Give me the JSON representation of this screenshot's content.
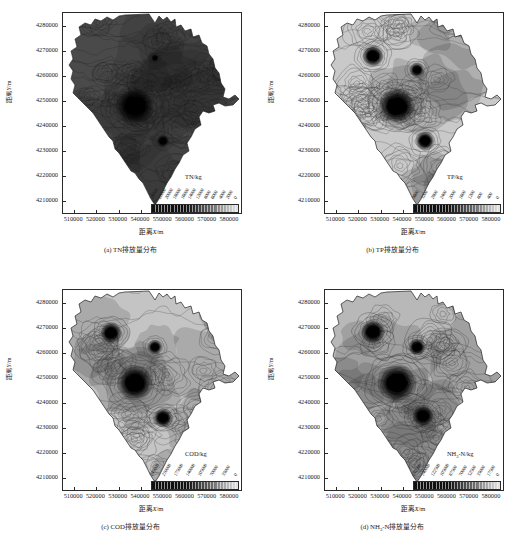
{
  "figure": {
    "axis": {
      "xlabel": "距离X/m",
      "ylabel": "距离Y/m",
      "xticks": [
        "510000",
        "520000",
        "530000",
        "540000",
        "550000",
        "560000",
        "570000",
        "580000"
      ],
      "yticks": [
        "4280000",
        "4270000",
        "4260000",
        "4250000",
        "4240000",
        "4230000",
        "4220000",
        "4210000"
      ],
      "xlim": [
        505000,
        585000
      ],
      "ylim": [
        4205000,
        4285000
      ]
    },
    "panels": [
      {
        "id": "a",
        "caption": "(a) TN排放量分布",
        "legend_title": "TN/kg",
        "legend_labels": [
          "24000",
          "22000",
          "20000",
          "18000",
          "16000",
          "14000",
          "12000",
          "8000",
          "6000",
          "4000",
          "2000",
          "0"
        ],
        "base_fill": "#4a4a4a",
        "contour_color": "#1f1f1f",
        "hotspots": [
          {
            "cx": 72,
            "cy": 93,
            "r": 16,
            "label": "major-hotspot-central"
          },
          {
            "cx": 100,
            "cy": 128,
            "r": 5,
            "label": "hotspot-south"
          },
          {
            "cx": 92,
            "cy": 45,
            "r": 3,
            "label": "hotspot-north"
          }
        ]
      },
      {
        "id": "b",
        "caption": "(b) TP排放量分布",
        "legend_title": "TP/kg",
        "legend_labels": [
          "3600",
          "3200",
          "2800",
          "2400",
          "2000",
          "1600",
          "1200",
          "800",
          "400",
          "0"
        ],
        "base_fill": "#c9c9c9",
        "contour_color": "#3b3b3b",
        "hotspots": [
          {
            "cx": 72,
            "cy": 93,
            "r": 15,
            "label": "major-hotspot-central"
          },
          {
            "cx": 48,
            "cy": 43,
            "r": 9,
            "label": "hotspot-northwest"
          },
          {
            "cx": 92,
            "cy": 57,
            "r": 6,
            "label": "hotspot-north"
          },
          {
            "cx": 100,
            "cy": 128,
            "r": 8,
            "label": "hotspot-south"
          }
        ]
      },
      {
        "id": "c",
        "caption": "(c) COD排放量分布",
        "legend_title": "COD/kg",
        "legend_labels": [
          "245000",
          "210000",
          "175000",
          "140000",
          "105000",
          "70000",
          "35000",
          "0"
        ],
        "base_fill": "#c4c4c4",
        "contour_color": "#3b3b3b",
        "hotspots": [
          {
            "cx": 72,
            "cy": 93,
            "r": 15,
            "label": "major-hotspot-central"
          },
          {
            "cx": 48,
            "cy": 43,
            "r": 9,
            "label": "hotspot-northwest"
          },
          {
            "cx": 92,
            "cy": 57,
            "r": 6,
            "label": "hotspot-north"
          },
          {
            "cx": 100,
            "cy": 128,
            "r": 8,
            "label": "hotspot-south"
          }
        ]
      },
      {
        "id": "d",
        "caption": "(d) NH₃-N排放量分布",
        "legend_title": "NH₃-N/kg",
        "legend_labels": [
          "157500",
          "140000",
          "122500",
          "105000",
          "87500",
          "70000",
          "52500",
          "35000",
          "17500",
          "0"
        ],
        "base_fill": "#b8b8b8",
        "contour_color": "#333333",
        "hotspots": [
          {
            "cx": 72,
            "cy": 93,
            "r": 16,
            "label": "major-hotspot-central"
          },
          {
            "cx": 48,
            "cy": 42,
            "r": 10,
            "label": "hotspot-northwest"
          },
          {
            "cx": 92,
            "cy": 57,
            "r": 7,
            "label": "hotspot-north"
          },
          {
            "cx": 98,
            "cy": 126,
            "r": 9,
            "label": "hotspot-south"
          }
        ]
      }
    ],
    "colorbar": {
      "dark": "#101010",
      "light": "#e8e8e8",
      "segments": 28
    }
  },
  "chart_data": {
    "type": "heatmap",
    "title": "",
    "subtitle": "",
    "xlabel": "距离X/m",
    "ylabel": "距离Y/m",
    "xlim": [
      505000,
      585000
    ],
    "ylim": [
      4205000,
      4285000
    ],
    "xticks": [
      510000,
      520000,
      530000,
      540000,
      550000,
      560000,
      570000,
      580000
    ],
    "yticks": [
      4210000,
      4220000,
      4230000,
      4240000,
      4250000,
      4260000,
      4270000,
      4280000
    ],
    "grid": false,
    "legend_position": "inside-bottom-right",
    "panels": [
      {
        "panel": "a",
        "caption": "(a) TN排放量分布",
        "variable": "TN",
        "unit": "kg",
        "colorbar_label": "TN/kg",
        "colorbar_ticks": [
          24000,
          22000,
          20000,
          18000,
          16000,
          14000,
          12000,
          8000,
          6000,
          4000,
          2000,
          0
        ],
        "vmin": 0,
        "vmax": 24000,
        "hotspot_points": [
          {
            "x": 530000,
            "y": 4248000,
            "intensity": 24000,
            "note": "主要高值中心"
          },
          {
            "x": 541000,
            "y": 4221000,
            "intensity": 18000,
            "note": "南部高值"
          },
          {
            "x": 538000,
            "y": 4259000,
            "intensity": 14000,
            "note": "北部高值"
          }
        ]
      },
      {
        "panel": "b",
        "caption": "(b) TP排放量分布",
        "variable": "TP",
        "unit": "kg",
        "colorbar_label": "TP/kg",
        "colorbar_ticks": [
          3600,
          3200,
          2800,
          2400,
          2000,
          1600,
          1200,
          800,
          400,
          0
        ],
        "vmin": 0,
        "vmax": 3600,
        "hotspot_points": [
          {
            "x": 530000,
            "y": 4248000,
            "intensity": 3600,
            "note": "主要高值中心"
          },
          {
            "x": 522000,
            "y": 4266000,
            "intensity": 2800,
            "note": "西北高值"
          },
          {
            "x": 539000,
            "y": 4259000,
            "intensity": 2000,
            "note": "北部高值"
          },
          {
            "x": 541000,
            "y": 4221000,
            "intensity": 2400,
            "note": "南部高值"
          }
        ]
      },
      {
        "panel": "c",
        "caption": "(c) COD排放量分布",
        "variable": "COD",
        "unit": "kg",
        "colorbar_label": "COD/kg",
        "colorbar_ticks": [
          245000,
          210000,
          175000,
          140000,
          105000,
          70000,
          35000,
          0
        ],
        "vmin": 0,
        "vmax": 245000,
        "hotspot_points": [
          {
            "x": 530000,
            "y": 4248000,
            "intensity": 245000,
            "note": "主要高值中心"
          },
          {
            "x": 522000,
            "y": 4266000,
            "intensity": 175000,
            "note": "西北高值"
          },
          {
            "x": 539000,
            "y": 4259000,
            "intensity": 140000,
            "note": "北部高值"
          },
          {
            "x": 541000,
            "y": 4221000,
            "intensity": 175000,
            "note": "南部高值"
          }
        ]
      },
      {
        "panel": "d",
        "caption": "(d) NH₃-N排放量分布",
        "variable": "NH₃-N",
        "unit": "kg",
        "colorbar_label": "NH₃-N/kg",
        "colorbar_ticks": [
          157500,
          140000,
          122500,
          105000,
          87500,
          70000,
          52500,
          35000,
          17500,
          0
        ],
        "vmin": 0,
        "vmax": 157500,
        "hotspot_points": [
          {
            "x": 530000,
            "y": 4248000,
            "intensity": 157500,
            "note": "主要高值中心"
          },
          {
            "x": 522000,
            "y": 4266000,
            "intensity": 122500,
            "note": "西北高值"
          },
          {
            "x": 539000,
            "y": 4259000,
            "intensity": 105000,
            "note": "北部高值"
          },
          {
            "x": 540000,
            "y": 4221000,
            "intensity": 122500,
            "note": "南部高值"
          }
        ]
      }
    ]
  }
}
